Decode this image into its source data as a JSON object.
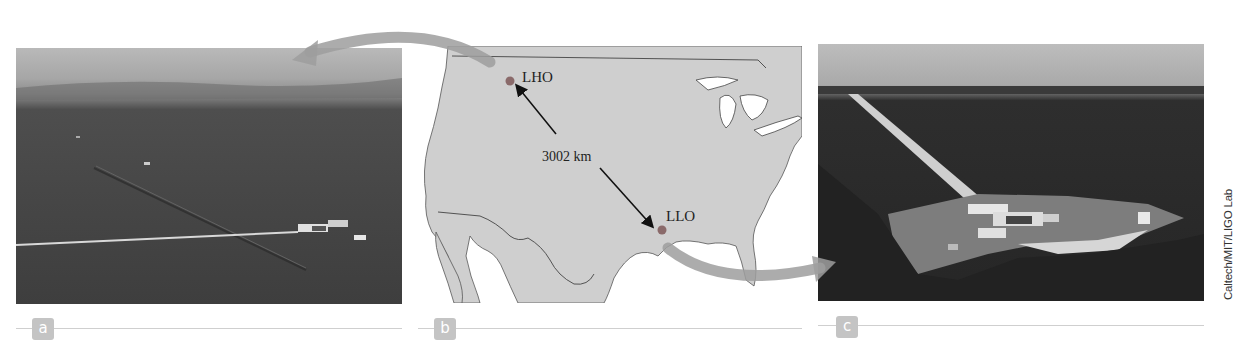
{
  "figure": {
    "panels": [
      {
        "id": "a",
        "label": "a",
        "description": "Aerial photograph of LIGO Hanford Observatory (LHO)"
      },
      {
        "id": "b",
        "label": "b",
        "description": "Map of the United States showing detector locations"
      },
      {
        "id": "c",
        "label": "c",
        "description": "Aerial photograph of LIGO Livingston Observatory (LLO)"
      }
    ],
    "map": {
      "sites": [
        {
          "name": "LHO",
          "color": "#8a6a6a"
        },
        {
          "name": "LLO",
          "color": "#8a6a6a"
        }
      ],
      "distance_label": "3002 km",
      "land_color": "#cfcfcf",
      "water_color": "#ffffff"
    },
    "credit": "Caltech/MIT/LIGO Lab",
    "colors": {
      "label_badge": "#c4c4c4",
      "swoosh_arrow": "#9e9e9e",
      "rule": "#cfcfcf"
    }
  }
}
